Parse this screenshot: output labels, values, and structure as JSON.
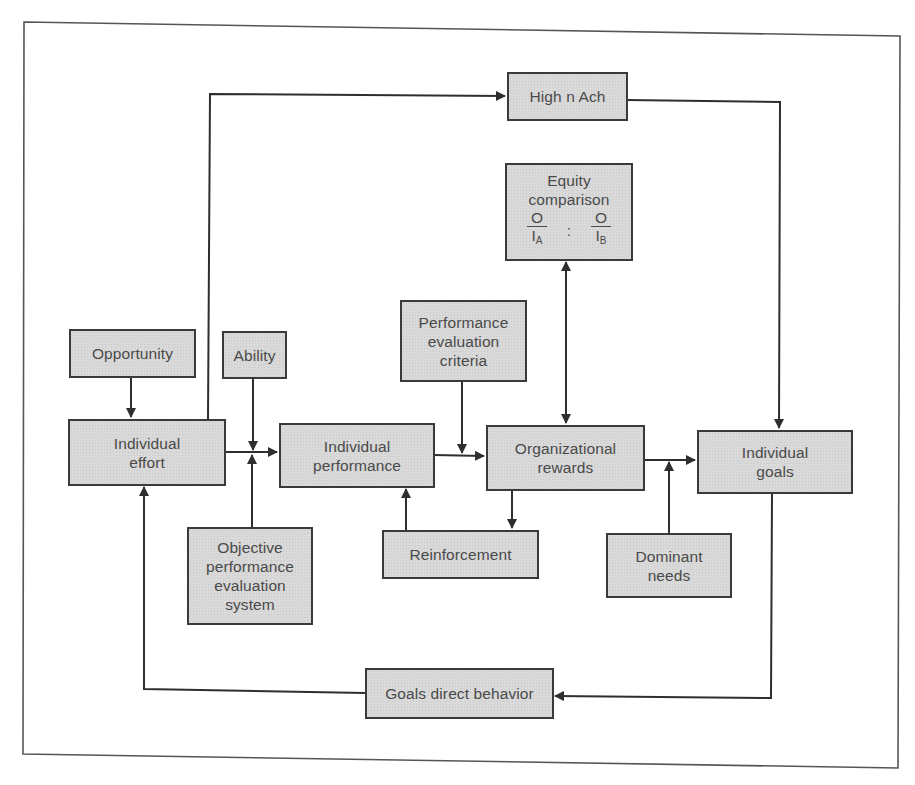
{
  "diagram": {
    "type": "flowchart",
    "title": "",
    "colors": {
      "box_fill": "#d9d9d9",
      "stroke": "#3a3a3a",
      "text": "#4a4a4a",
      "background": "#ffffff"
    },
    "nodes": {
      "high_n_ach": {
        "label": "High n Ach"
      },
      "equity": {
        "line1": "Equity",
        "line2": "comparison",
        "left_num": "O",
        "left_den": "I",
        "left_sub": "A",
        "separator": ":",
        "right_num": "O",
        "right_den": "I",
        "right_sub": "B"
      },
      "opportunity": {
        "label": "Opportunity"
      },
      "ability": {
        "label": "Ability"
      },
      "perf_eval_criteria": {
        "line1": "Performance",
        "line2": "evaluation",
        "line3": "criteria"
      },
      "individual_effort": {
        "line1": "Individual",
        "line2": "effort"
      },
      "individual_performance": {
        "line1": "Individual",
        "line2": "performance"
      },
      "organizational_rewards": {
        "line1": "Organizational",
        "line2": "rewards"
      },
      "individual_goals": {
        "line1": "Individual",
        "line2": "goals"
      },
      "objective_system": {
        "line1": "Objective",
        "line2": "performance",
        "line3": "evaluation",
        "line4": "system"
      },
      "reinforcement": {
        "label": "Reinforcement"
      },
      "dominant_needs": {
        "line1": "Dominant",
        "line2": "needs"
      },
      "goals_direct_behavior": {
        "label": "Goals direct behavior"
      }
    },
    "edges": [
      {
        "from": "Individual effort",
        "to": "High n Ach"
      },
      {
        "from": "High n Ach",
        "to": "Individual goals"
      },
      {
        "from": "Equity comparison",
        "to": "Organizational rewards",
        "bidirectional": true
      },
      {
        "from": "Opportunity",
        "to": "Individual effort"
      },
      {
        "from": "Ability",
        "to": "Individual performance"
      },
      {
        "from": "Objective performance evaluation system",
        "to": "Individual performance"
      },
      {
        "from": "Individual effort",
        "to": "Individual performance"
      },
      {
        "from": "Individual performance",
        "to": "Organizational rewards"
      },
      {
        "from": "Performance evaluation criteria",
        "to": "Organizational rewards"
      },
      {
        "from": "Reinforcement",
        "to": "Individual performance"
      },
      {
        "from": "Organizational rewards",
        "to": "Reinforcement"
      },
      {
        "from": "Organizational rewards",
        "to": "Individual goals"
      },
      {
        "from": "Dominant needs",
        "to": "Individual goals"
      },
      {
        "from": "Individual goals",
        "to": "Goals direct behavior"
      },
      {
        "from": "Goals direct behavior",
        "to": "Individual effort"
      }
    ]
  }
}
